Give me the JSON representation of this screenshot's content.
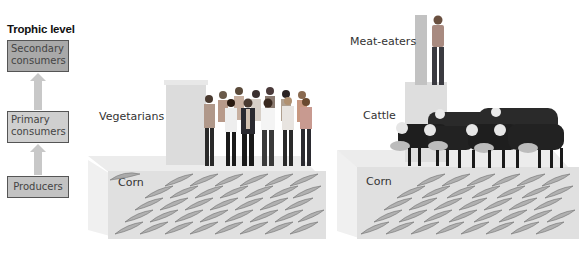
{
  "legend": {
    "title": "Trophic level",
    "levels": [
      {
        "label": "Secondary consumers",
        "line1": "Secondary",
        "line2": "consumers",
        "color": "#a9a9a9"
      },
      {
        "label": "Primary consumers",
        "line1": "Primary",
        "line2": "consumers",
        "color": "#cfcfcf"
      },
      {
        "label": "Producers",
        "line1": "Producers",
        "color": "#c3c3c3"
      }
    ]
  },
  "left_pyramid": {
    "top_label": "Vegetarians",
    "base_label": "Corn"
  },
  "right_pyramid": {
    "top_label": "Meat-eaters",
    "middle_label": "Cattle",
    "base_label": "Corn"
  }
}
